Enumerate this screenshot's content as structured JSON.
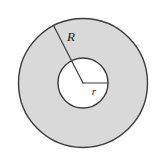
{
  "figure": {
    "name": "annulus-diagram",
    "type": "geometry-diagram",
    "background_color": "#ffffff",
    "ring_fill_color": "#d9d9d9",
    "inner_fill_color": "#ffffff",
    "stroke_color": "#3c3c3c",
    "label_color": "#1a1a1a",
    "center": {
      "x": 83,
      "y": 83
    },
    "outer_circle": {
      "name": "outer-circle",
      "radius": 64.5,
      "stroke_width": 1.4
    },
    "inner_circle": {
      "name": "inner-circle",
      "radius": 25,
      "stroke_width": 1.4
    },
    "outer_radius_line": {
      "name": "outer-radius-line",
      "from": {
        "x": 83,
        "y": 83
      },
      "to": {
        "x": 53.5,
        "y": 25.5
      },
      "stroke_width": 1.2
    },
    "inner_radius_line": {
      "name": "inner-radius-line",
      "from": {
        "x": 83,
        "y": 83
      },
      "to": {
        "x": 108,
        "y": 83
      },
      "stroke_width": 1.2
    },
    "labels": {
      "outer_radius": {
        "text": "R",
        "x": 71,
        "y": 41,
        "font_size": 13
      },
      "inner_radius": {
        "text": "r",
        "x": 94,
        "y": 95,
        "font_size": 11
      }
    }
  }
}
